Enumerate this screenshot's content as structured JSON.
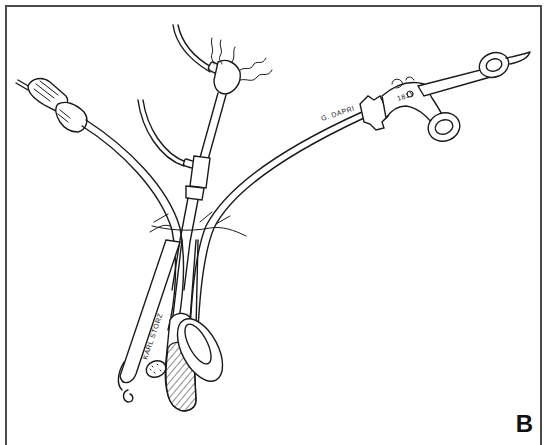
{
  "figure": {
    "panel_label": "B",
    "border_color": "#4a4a4a",
    "line_color": "#1a1a1a",
    "background": "#ffffff"
  },
  "labels": {
    "grasper_inscription": "G. DAPRI",
    "scope_inscription": "KARL STORZ",
    "handle_mark": "1811"
  },
  "instruments": [
    {
      "name": "curved grasper with ring handles",
      "inscription": "G. DAPRI"
    },
    {
      "name": "optical scope with light connector"
    },
    {
      "name": "suction-irrigation cannula with tubing"
    },
    {
      "name": "hook electrode instrument",
      "inscription": "KARL STORZ"
    },
    {
      "name": "cannula with hatched tip"
    },
    {
      "name": "oval ring forceps tip"
    }
  ]
}
